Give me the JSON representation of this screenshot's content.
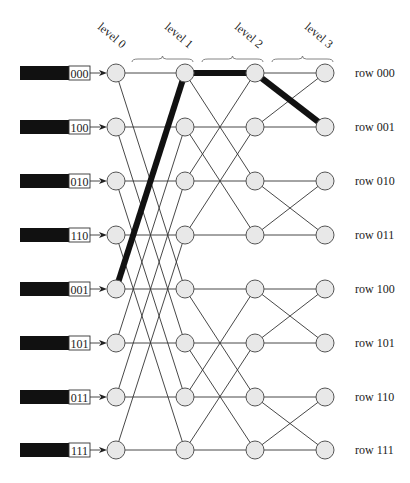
{
  "diagram": {
    "type": "butterfly-network",
    "levels": [
      "level 0",
      "level 1",
      "level 2",
      "level 3"
    ],
    "inputs": [
      "000",
      "100",
      "010",
      "110",
      "001",
      "101",
      "011",
      "111"
    ],
    "rows": [
      "row 000",
      "row 001",
      "row 010",
      "row 011",
      "row 100",
      "row 101",
      "row 110",
      "row 111"
    ],
    "highlighted_path": [
      {
        "level": 0,
        "row": 4
      },
      {
        "level": 1,
        "row": 0
      },
      {
        "level": 2,
        "row": 0
      },
      {
        "level": 3,
        "row": 1
      }
    ],
    "colors": {
      "node_fill": "#e8e8e8",
      "node_stroke": "#555555",
      "path": "#111111",
      "input_bar": "#111111"
    }
  }
}
